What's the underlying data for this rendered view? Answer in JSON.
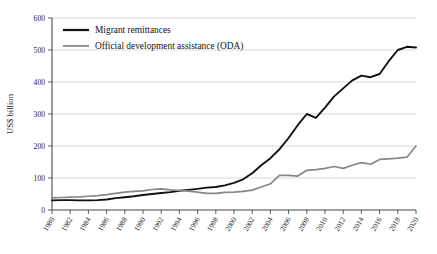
{
  "chart_data": {
    "type": "line",
    "title": "",
    "xlabel": "",
    "ylabel": "US$ billion",
    "xlim": [
      1980,
      2020
    ],
    "ylim": [
      0,
      600
    ],
    "grid": true,
    "legend_position": "top-left",
    "x_tick_labels": [
      "1980",
      "1982",
      "1984",
      "1986",
      "1988",
      "1990",
      "1992",
      "1994",
      "1996",
      "1998",
      "2000",
      "2002",
      "2004",
      "2006",
      "2008",
      "2010",
      "2012",
      "2014",
      "2016",
      "2018",
      "2020"
    ],
    "y_tick_labels": [
      "0",
      "100",
      "200",
      "300",
      "400",
      "500",
      "600"
    ],
    "y_ticks": [
      0,
      100,
      200,
      300,
      400,
      500,
      600
    ],
    "x": [
      1980,
      1981,
      1982,
      1983,
      1984,
      1985,
      1986,
      1987,
      1988,
      1989,
      1990,
      1991,
      1992,
      1993,
      1994,
      1995,
      1996,
      1997,
      1998,
      1999,
      2000,
      2001,
      2002,
      2003,
      2004,
      2005,
      2006,
      2007,
      2008,
      2009,
      2010,
      2011,
      2012,
      2013,
      2014,
      2015,
      2016,
      2017,
      2018,
      2019,
      2020
    ],
    "series": [
      {
        "name": "Migrant remittances",
        "color": "#111111",
        "width": 1.9,
        "values": [
          30,
          31,
          31,
          30,
          30,
          31,
          33,
          37,
          40,
          43,
          47,
          50,
          53,
          56,
          60,
          63,
          66,
          70,
          72,
          77,
          85,
          96,
          115,
          140,
          162,
          190,
          225,
          265,
          300,
          288,
          320,
          355,
          380,
          405,
          420,
          415,
          425,
          465,
          500,
          510,
          508
        ]
      },
      {
        "name": "Official development assistance (ODA)",
        "color": "#878787",
        "width": 1.7,
        "values": [
          38,
          39,
          40,
          41,
          43,
          45,
          48,
          52,
          56,
          58,
          60,
          64,
          66,
          63,
          61,
          59,
          56,
          52,
          52,
          55,
          56,
          58,
          62,
          72,
          82,
          108,
          108,
          106,
          124,
          126,
          130,
          136,
          130,
          140,
          148,
          143,
          158,
          160,
          162,
          165,
          200
        ]
      }
    ]
  },
  "legend": {
    "items": [
      {
        "label": "Migrant remittances",
        "color": "#111111"
      },
      {
        "label": "Official development assistance (ODA)",
        "color": "#878787"
      }
    ]
  }
}
